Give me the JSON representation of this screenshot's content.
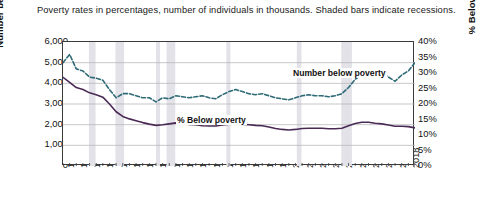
{
  "caption": "Poverty rates in percentages, number of individuals in thousands. Shaded bars indicate recessions.",
  "axes": {
    "left_label": "Number below poverty",
    "right_label": "% Below poverty",
    "left_ticks": [
      "6,000",
      "5,000",
      "4,000",
      "3,000",
      "2,000",
      "1,000",
      "0"
    ],
    "right_ticks": [
      "40%",
      "35%",
      "30%",
      "25%",
      "20%",
      "15%",
      "10%",
      "5%",
      "0%"
    ],
    "x_ticks": [
      "1966",
      "1968",
      "1970",
      "1972",
      "1974",
      "1976",
      "1978",
      "1980",
      "1982",
      "1984",
      "1986",
      "1988",
      "1990",
      "1992",
      "1994",
      "1996",
      "1998",
      "2000",
      "2002",
      "2004",
      "2006",
      "2008",
      "2010",
      "2012",
      "2014",
      "2016",
      "2018"
    ]
  },
  "annotations": {
    "number_series": "Number below poverty",
    "percent_series": "% Below poverty"
  },
  "colors": {
    "number_series": "#2e6b77",
    "percent_series": "#4a2a55",
    "recession_band": "#e2e2e8",
    "gridline": "#b9b9b9",
    "frame": "#3b3b3b"
  },
  "chart_data": {
    "type": "line",
    "title": "",
    "subtitle": "Poverty rates in percentages, number of individuals in thousands. Shaded bars indicate recessions.",
    "xlabel": "",
    "ylabel": "Number below poverty",
    "ylabel_secondary": "% Below poverty",
    "xlim": [
      1966,
      2019
    ],
    "ylim": [
      0,
      6000
    ],
    "ylim_secondary": [
      0,
      40
    ],
    "grid": true,
    "legend": "inline-annotations",
    "x": [
      1966,
      1967,
      1968,
      1969,
      1970,
      1971,
      1972,
      1973,
      1974,
      1975,
      1976,
      1977,
      1978,
      1979,
      1980,
      1981,
      1982,
      1983,
      1984,
      1985,
      1986,
      1987,
      1988,
      1989,
      1990,
      1991,
      1992,
      1993,
      1994,
      1995,
      1996,
      1997,
      1998,
      1999,
      2000,
      2001,
      2002,
      2003,
      2004,
      2005,
      2006,
      2007,
      2008,
      2009,
      2010,
      2011,
      2012,
      2013,
      2014,
      2015,
      2016,
      2017,
      2018,
      2019
    ],
    "series": [
      {
        "name": "Number below poverty",
        "axis": "left",
        "units": "thousands",
        "style": "dashed",
        "color": "#2e6b77",
        "values": [
          5000,
          5400,
          4700,
          4600,
          4300,
          4250,
          4150,
          3700,
          3300,
          3500,
          3500,
          3400,
          3300,
          3300,
          3100,
          3300,
          3250,
          3400,
          3350,
          3300,
          3350,
          3400,
          3300,
          3250,
          3450,
          3600,
          3700,
          3600,
          3500,
          3450,
          3500,
          3400,
          3300,
          3250,
          3200,
          3300,
          3400,
          3450,
          3400,
          3400,
          3350,
          3400,
          3500,
          3800,
          4200,
          4400,
          4500,
          4350,
          4500,
          4300,
          4100,
          4400,
          4600,
          5000
        ]
      },
      {
        "name": "% Below poverty",
        "axis": "right",
        "units": "percent",
        "style": "solid",
        "color": "#4a2a55",
        "values": [
          28.6,
          27.0,
          25.3,
          24.7,
          23.6,
          23.0,
          22.2,
          20.0,
          17.5,
          16.0,
          15.2,
          14.6,
          14.0,
          13.5,
          13.1,
          13.3,
          13.6,
          13.9,
          13.7,
          13.4,
          13.3,
          13.0,
          12.9,
          12.9,
          13.2,
          13.5,
          13.7,
          13.5,
          13.3,
          13.1,
          13.0,
          12.6,
          12.1,
          11.8,
          11.6,
          11.8,
          12.1,
          12.2,
          12.2,
          12.2,
          12.0,
          12.0,
          12.2,
          13.0,
          13.7,
          14.1,
          14.1,
          13.8,
          13.6,
          13.2,
          12.8,
          12.8,
          12.7,
          12.3
        ]
      }
    ],
    "recessions": [
      {
        "start": 1969.9,
        "end": 1970.9
      },
      {
        "start": 1973.9,
        "end": 1975.2
      },
      {
        "start": 1980.0,
        "end": 1980.6
      },
      {
        "start": 1981.6,
        "end": 1982.9
      },
      {
        "start": 1990.6,
        "end": 1991.2
      },
      {
        "start": 2001.2,
        "end": 2001.9
      },
      {
        "start": 2007.9,
        "end": 2009.5
      }
    ]
  }
}
